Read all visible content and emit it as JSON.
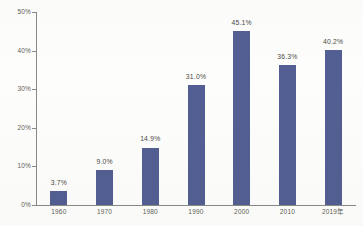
{
  "chart_data": {
    "type": "bar",
    "title": "",
    "xlabel": "",
    "ylabel": "",
    "categories": [
      "1960",
      "1970",
      "1980",
      "1990",
      "2000",
      "2010",
      "2019年"
    ],
    "values": [
      3.7,
      9.0,
      14.9,
      31.0,
      45.1,
      36.3,
      40.2
    ],
    "data_labels": [
      "3.7%",
      "9.0%",
      "14.9%",
      "31.0%",
      "45.1%",
      "36.3%",
      "40.2%"
    ],
    "ylim": [
      0,
      50
    ],
    "ytick_values": [
      0,
      10,
      20,
      30,
      40,
      50
    ],
    "ytick_labels": [
      "0%",
      "10%",
      "20%",
      "30%",
      "40%",
      "50%"
    ],
    "grid": false,
    "legend": null,
    "series": [
      {
        "name": "",
        "values": [
          3.7,
          9.0,
          14.9,
          31.0,
          45.1,
          36.3,
          40.2
        ],
        "color": "#535F92"
      }
    ]
  },
  "style": {
    "bar_color": "#535F92",
    "axis_color": "#8A8A84",
    "text_color": "#5D5D58",
    "label_color": "#4A4A46",
    "background": "#FDFDFB"
  }
}
